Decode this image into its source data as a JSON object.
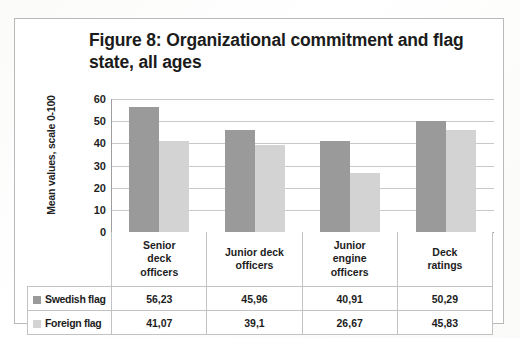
{
  "figure": {
    "title": "Figure 8: Organizational commitment and flag state, all ages"
  },
  "chart_data": {
    "type": "bar",
    "title": "Figure 8: Organizational commitment and flag state, all ages",
    "xlabel": "",
    "ylabel": "Mean values, scale 0-100",
    "ylim": [
      0,
      60
    ],
    "yticks": [
      "60",
      "50",
      "40",
      "30",
      "20",
      "10",
      "0"
    ],
    "ytick_values": [
      60,
      50,
      40,
      30,
      20,
      10,
      0
    ],
    "grid": true,
    "legend_position": "table-below",
    "categories": [
      "Senior deck officers",
      "Junior deck officers",
      "Junior engine officers",
      "Deck ratings"
    ],
    "category_lines": [
      [
        "Senior",
        "deck",
        "officers"
      ],
      [
        "Junior deck",
        "officers"
      ],
      [
        "Junior",
        "engine",
        "officers"
      ],
      [
        "Deck",
        "ratings"
      ]
    ],
    "series": [
      {
        "name": "Swedish flag",
        "color": "#9a9a9a",
        "values": [
          56.23,
          45.96,
          40.91,
          50.29
        ],
        "labels": [
          "56,23",
          "45,96",
          "40,91",
          "50,29"
        ]
      },
      {
        "name": "Foreign flag",
        "color": "#d3d3d3",
        "values": [
          41.07,
          39.1,
          26.67,
          45.83
        ],
        "labels": [
          "41,07",
          "39,1",
          "26,67",
          "45,83"
        ]
      }
    ]
  },
  "colors": {
    "series_swedish": "#9a9a9a",
    "series_foreign": "#d3d3d3",
    "frame_border": "#b9b9b9",
    "gridline": "#c9c9c9",
    "axis": "#9e9e9e"
  }
}
